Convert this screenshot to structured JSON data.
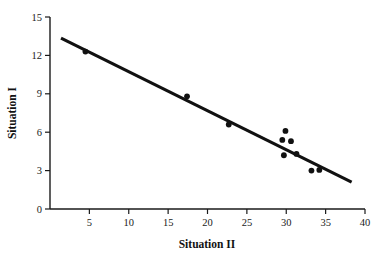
{
  "chart_data": {
    "type": "scatter",
    "title": "",
    "subtitle": "",
    "xlabel": "Situation II",
    "ylabel": "Situation I",
    "xlim": [
      0,
      40
    ],
    "ylim": [
      0,
      15
    ],
    "xticks": [
      5,
      10,
      15,
      20,
      25,
      30,
      35,
      40
    ],
    "xtick_labels": [
      "5",
      "10",
      "15",
      "20",
      "25",
      "30",
      "35",
      "40"
    ],
    "yticks": [
      0,
      3,
      6,
      9,
      12,
      15
    ],
    "ytick_labels": [
      "0",
      "3",
      "6",
      "9",
      "12",
      "15"
    ],
    "grid": false,
    "legend": null,
    "legend_position": "none",
    "marker": "filled-circle",
    "marker_color": "#111111",
    "points": [
      {
        "x": 4.5,
        "y": 12.3
      },
      {
        "x": 17.4,
        "y": 8.8
      },
      {
        "x": 22.7,
        "y": 6.6
      },
      {
        "x": 29.9,
        "y": 6.1
      },
      {
        "x": 29.5,
        "y": 5.4
      },
      {
        "x": 30.6,
        "y": 5.3
      },
      {
        "x": 29.7,
        "y": 4.2
      },
      {
        "x": 31.3,
        "y": 4.3
      },
      {
        "x": 33.2,
        "y": 3.0
      },
      {
        "x": 34.2,
        "y": 3.05
      }
    ],
    "series": [
      {
        "name": "observations",
        "type": "scatter",
        "x": [
          4.5,
          17.4,
          22.7,
          29.9,
          29.5,
          30.6,
          29.7,
          31.3,
          33.2,
          34.2
        ],
        "values": [
          12.3,
          8.8,
          6.6,
          6.1,
          5.4,
          5.3,
          4.2,
          4.3,
          3.0,
          3.05
        ]
      },
      {
        "name": "regression-line",
        "type": "line",
        "color": "#111111",
        "x": [
          1.4,
          38.3
        ],
        "values": [
          13.35,
          2.1
        ]
      }
    ],
    "trendline": {
      "x_start": 1.4,
      "y_start": 13.35,
      "x_end": 38.3,
      "y_end": 2.1,
      "slope": -0.305,
      "intercept": 13.78
    },
    "annotations": []
  },
  "axes": {
    "x_title": "Situation II",
    "y_title": "Situation I"
  }
}
